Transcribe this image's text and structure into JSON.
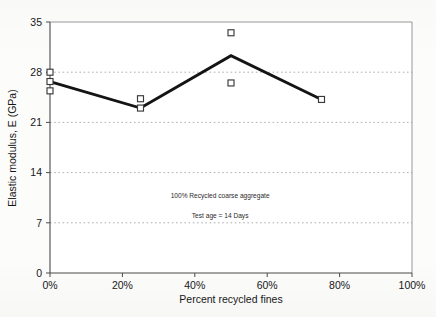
{
  "chart_data": {
    "type": "line",
    "title": "",
    "xlabel": "Percent recycled fines",
    "ylabel": "Elastic modulus, E (GPa)",
    "xlim": [
      0,
      100
    ],
    "ylim": [
      0,
      35
    ],
    "xticks": [
      0,
      20,
      40,
      60,
      80,
      100
    ],
    "xtick_labels": [
      "0%",
      "20%",
      "40%",
      "60%",
      "80%",
      "100%"
    ],
    "yticks": [
      0,
      7,
      14,
      21,
      28,
      35
    ],
    "ytick_labels": [
      "0",
      "7",
      "14",
      "21",
      "28",
      "35"
    ],
    "grid": "horizontal-dotted",
    "gridlines_y": [
      7,
      14,
      21,
      28
    ],
    "legend": "none",
    "series": [
      {
        "name": "Mean elastic modulus",
        "style": "thick-solid-line",
        "color": "#141414",
        "x": [
          0,
          25,
          50,
          75
        ],
        "values": [
          26.7,
          23.0,
          30.3,
          24.2
        ]
      },
      {
        "name": "Individual specimen results",
        "style": "open-square-markers",
        "color": "#3a3a3a",
        "x": [
          0,
          0,
          0,
          25,
          25,
          50,
          50,
          75
        ],
        "values": [
          28.0,
          26.7,
          25.4,
          24.3,
          23.0,
          33.5,
          26.5,
          24.2
        ]
      }
    ],
    "annotations": [
      {
        "text": "100% Recycled coarse aggregate",
        "x": 47,
        "y": 10.4
      },
      {
        "text": "Test  age = 14 Days",
        "x": 47,
        "y": 7.6
      }
    ]
  },
  "axes": {
    "y_title": "Elastic modulus, E (GPa)",
    "x_title": "Percent recycled fines"
  },
  "notes": {
    "line1": "100% Recycled coarse aggregate",
    "line2": "Test  age = 14 Days"
  },
  "colors": {
    "series_line": "#141414",
    "marker_stroke": "#3a3a3a",
    "marker_fill": "#ffffff",
    "axis": "#4a4a4a",
    "grid": "#9a9a9a",
    "text": "#171717",
    "background": "#fcfcfb"
  }
}
